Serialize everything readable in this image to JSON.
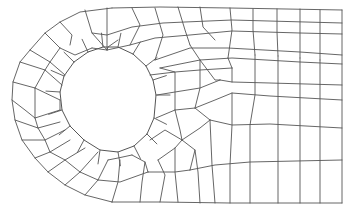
{
  "diagram": {
    "type": "quadrilateral finite element mesh",
    "colors": {
      "background": "#ffffff",
      "line": "#555555"
    },
    "outer_boundary": {
      "right_edge_x": 342,
      "top_y": 10,
      "bottom_y": 203,
      "arc_center": [
        112,
        106
      ],
      "arc_radius": 98,
      "arc_start_x": 112
    },
    "hole": {
      "center": [
        108,
        95
      ],
      "radius": 48,
      "segments": 14
    },
    "polylines": [
      [
        [
          112,
          8
        ],
        [
          160,
          7
        ],
        [
          230,
          8
        ],
        [
          342,
          10
        ]
      ],
      [
        [
          342,
          10
        ],
        [
          342,
          203
        ]
      ],
      [
        [
          342,
          203
        ],
        [
          230,
          203
        ],
        [
          160,
          202
        ],
        [
          112,
          202
        ]
      ],
      [
        [
          112,
          8
        ],
        [
          80,
          12
        ],
        [
          60,
          22
        ],
        [
          45,
          33
        ],
        [
          30,
          50
        ],
        [
          20,
          62
        ],
        [
          13,
          82
        ],
        [
          12,
          100
        ],
        [
          15,
          120
        ],
        [
          22,
          140
        ],
        [
          35,
          158
        ],
        [
          48,
          172
        ],
        [
          65,
          185
        ],
        [
          85,
          195
        ],
        [
          112,
          202
        ]
      ],
      [
        [
          60,
          22
        ],
        [
          72,
          35
        ],
        [
          70,
          45
        ]
      ],
      [
        [
          85,
          10
        ],
        [
          92,
          33
        ],
        [
          107,
          50
        ]
      ],
      [
        [
          107,
          8
        ],
        [
          107,
          35
        ],
        [
          107,
          50
        ]
      ],
      [
        [
          132,
          8
        ],
        [
          140,
          25
        ],
        [
          130,
          45
        ]
      ],
      [
        [
          155,
          8
        ],
        [
          163,
          35
        ],
        [
          155,
          60
        ]
      ],
      [
        [
          178,
          7
        ],
        [
          185,
          30
        ],
        [
          190,
          45
        ]
      ],
      [
        [
          200,
          7
        ],
        [
          203,
          27
        ],
        [
          215,
          40
        ]
      ],
      [
        [
          230,
          8
        ],
        [
          232,
          30
        ],
        [
          228,
          58
        ]
      ],
      [
        [
          253,
          9
        ],
        [
          253,
          30
        ],
        [
          255,
          55
        ]
      ],
      [
        [
          277,
          9
        ],
        [
          277,
          32
        ],
        [
          278,
          56
        ]
      ],
      [
        [
          300,
          9
        ],
        [
          300,
          32
        ],
        [
          300,
          58
        ]
      ],
      [
        [
          320,
          10
        ],
        [
          320,
          33
        ],
        [
          320,
          60
        ]
      ],
      [
        [
          30,
          50
        ],
        [
          50,
          62
        ],
        [
          65,
          75
        ]
      ],
      [
        [
          45,
          33
        ],
        [
          60,
          48
        ],
        [
          75,
          55
        ],
        [
          92,
          48
        ]
      ],
      [
        [
          92,
          33
        ],
        [
          107,
          35
        ],
        [
          132,
          27
        ],
        [
          163,
          23
        ],
        [
          185,
          22
        ],
        [
          232,
          20
        ],
        [
          342,
          23
        ]
      ],
      [
        [
          92,
          48
        ],
        [
          107,
          50
        ],
        [
          130,
          45
        ],
        [
          155,
          38
        ],
        [
          190,
          35
        ],
        [
          232,
          31
        ],
        [
          300,
          33
        ],
        [
          342,
          34
        ]
      ],
      [
        [
          107,
          50
        ],
        [
          108,
          47
        ],
        [
          118,
          40
        ]
      ],
      [
        [
          155,
          60
        ],
        [
          190,
          48
        ],
        [
          228,
          48
        ],
        [
          300,
          52
        ],
        [
          342,
          55
        ]
      ],
      [
        [
          160,
          68
        ],
        [
          200,
          60
        ],
        [
          232,
          58
        ],
        [
          300,
          62
        ],
        [
          342,
          64
        ]
      ],
      [
        [
          20,
          62
        ],
        [
          45,
          70
        ],
        [
          62,
          85
        ]
      ],
      [
        [
          13,
          82
        ],
        [
          35,
          88
        ],
        [
          60,
          100
        ]
      ],
      [
        [
          12,
          100
        ],
        [
          25,
          110
        ],
        [
          35,
          118
        ],
        [
          60,
          110
        ]
      ],
      [
        [
          15,
          120
        ],
        [
          38,
          128
        ],
        [
          60,
          122
        ]
      ],
      [
        [
          22,
          140
        ],
        [
          45,
          140
        ],
        [
          65,
          130
        ]
      ],
      [
        [
          35,
          158
        ],
        [
          50,
          152
        ],
        [
          70,
          140
        ]
      ],
      [
        [
          48,
          172
        ],
        [
          65,
          160
        ],
        [
          85,
          148
        ]
      ],
      [
        [
          65,
          185
        ],
        [
          80,
          172
        ],
        [
          98,
          152
        ]
      ],
      [
        [
          85,
          195
        ],
        [
          98,
          180
        ],
        [
          108,
          160
        ]
      ],
      [
        [
          60,
          100
        ],
        [
          60,
          110
        ]
      ],
      [
        [
          45,
          70
        ],
        [
          50,
          62
        ],
        [
          60,
          48
        ]
      ],
      [
        [
          35,
          88
        ],
        [
          45,
          70
        ]
      ],
      [
        [
          35,
          118
        ],
        [
          35,
          88
        ]
      ],
      [
        [
          38,
          128
        ],
        [
          35,
          118
        ]
      ],
      [
        [
          45,
          140
        ],
        [
          38,
          128
        ]
      ],
      [
        [
          50,
          152
        ],
        [
          45,
          140
        ]
      ],
      [
        [
          65,
          160
        ],
        [
          50,
          152
        ]
      ],
      [
        [
          80,
          172
        ],
        [
          65,
          160
        ]
      ],
      [
        [
          98,
          180
        ],
        [
          80,
          172
        ]
      ],
      [
        [
          108,
          160
        ],
        [
          118,
          158
        ],
        [
          132,
          155
        ]
      ],
      [
        [
          98,
          180
        ],
        [
          120,
          182
        ],
        [
          148,
          172
        ]
      ],
      [
        [
          112,
          202
        ],
        [
          118,
          182
        ],
        [
          120,
          160
        ]
      ],
      [
        [
          132,
          155
        ],
        [
          145,
          162
        ],
        [
          148,
          172
        ]
      ],
      [
        [
          148,
          172
        ],
        [
          175,
          172
        ],
        [
          190,
          170
        ]
      ],
      [
        [
          160,
          202
        ],
        [
          165,
          175
        ],
        [
          158,
          160
        ]
      ],
      [
        [
          190,
          170
        ],
        [
          195,
          150
        ],
        [
          182,
          140
        ]
      ],
      [
        [
          182,
          140
        ],
        [
          200,
          128
        ],
        [
          210,
          120
        ]
      ],
      [
        [
          158,
          160
        ],
        [
          175,
          148
        ],
        [
          182,
          140
        ]
      ],
      [
        [
          150,
          140
        ],
        [
          165,
          130
        ],
        [
          182,
          140
        ]
      ],
      [
        [
          156,
          118
        ],
        [
          175,
          110
        ],
        [
          195,
          108
        ],
        [
          210,
          120
        ]
      ],
      [
        [
          157,
          95
        ],
        [
          175,
          92
        ],
        [
          200,
          88
        ],
        [
          220,
          80
        ]
      ],
      [
        [
          150,
          75
        ],
        [
          175,
          72
        ],
        [
          200,
          70
        ],
        [
          232,
          68
        ]
      ],
      [
        [
          210,
          120
        ],
        [
          232,
          125
        ],
        [
          270,
          124
        ],
        [
          342,
          128
        ]
      ],
      [
        [
          190,
          170
        ],
        [
          215,
          165
        ],
        [
          250,
          162
        ],
        [
          342,
          160
        ]
      ],
      [
        [
          195,
          108
        ],
        [
          215,
          100
        ],
        [
          232,
          93
        ],
        [
          270,
          96
        ],
        [
          342,
          100
        ]
      ],
      [
        [
          220,
          80
        ],
        [
          232,
          82
        ],
        [
          270,
          83
        ],
        [
          342,
          85
        ]
      ],
      [
        [
          232,
          68
        ],
        [
          232,
          82
        ]
      ],
      [
        [
          190,
          45
        ],
        [
          200,
          60
        ],
        [
          215,
          80
        ],
        [
          220,
          80
        ]
      ],
      [
        [
          228,
          58
        ],
        [
          232,
          68
        ]
      ],
      [
        [
          255,
          55
        ],
        [
          255,
          68
        ],
        [
          255,
          95
        ],
        [
          250,
          125
        ],
        [
          250,
          162
        ],
        [
          250,
          203
        ]
      ],
      [
        [
          278,
          56
        ],
        [
          278,
          70
        ],
        [
          278,
          96
        ],
        [
          278,
          124
        ],
        [
          278,
          160
        ],
        [
          278,
          203
        ]
      ],
      [
        [
          300,
          58
        ],
        [
          300,
          65
        ],
        [
          300,
          98
        ],
        [
          300,
          126
        ],
        [
          300,
          160
        ],
        [
          300,
          203
        ]
      ],
      [
        [
          320,
          60
        ],
        [
          320,
          65
        ],
        [
          320,
          99
        ],
        [
          320,
          127
        ],
        [
          320,
          160
        ],
        [
          320,
          203
        ]
      ],
      [
        [
          232,
          93
        ],
        [
          232,
          125
        ],
        [
          230,
          165
        ],
        [
          230,
          203
        ]
      ],
      [
        [
          210,
          120
        ],
        [
          212,
          165
        ],
        [
          215,
          203
        ]
      ],
      [
        [
          195,
          150
        ],
        [
          198,
          172
        ],
        [
          200,
          203
        ]
      ],
      [
        [
          175,
          148
        ],
        [
          175,
          172
        ],
        [
          178,
          202
        ]
      ],
      [
        [
          145,
          162
        ],
        [
          142,
          182
        ],
        [
          140,
          202
        ]
      ],
      [
        [
          175,
          110
        ],
        [
          180,
          130
        ],
        [
          182,
          140
        ]
      ],
      [
        [
          160,
          68
        ],
        [
          175,
          72
        ],
        [
          175,
          92
        ],
        [
          175,
          110
        ]
      ],
      [
        [
          200,
          60
        ],
        [
          200,
          70
        ],
        [
          200,
          88
        ],
        [
          195,
          108
        ]
      ]
    ],
    "hole_polygon": [
      [
        156,
        95
      ],
      [
        153,
        80
      ],
      [
        146,
        66
      ],
      [
        133,
        54
      ],
      [
        118,
        47
      ],
      [
        103,
        47
      ],
      [
        88,
        52
      ],
      [
        74,
        62
      ],
      [
        64,
        76
      ],
      [
        60,
        92
      ],
      [
        62,
        110
      ],
      [
        70,
        126
      ],
      [
        84,
        140
      ],
      [
        100,
        150
      ],
      [
        118,
        152
      ],
      [
        134,
        146
      ],
      [
        147,
        134
      ],
      [
        154,
        118
      ]
    ]
  }
}
